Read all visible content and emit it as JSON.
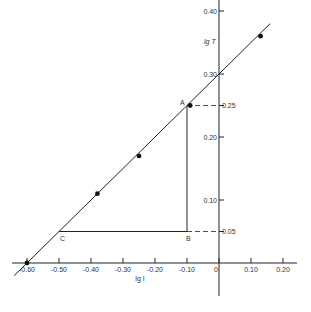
{
  "chart_data": {
    "type": "line",
    "title": "",
    "xlabel": "lg I",
    "ylabel": "lg T",
    "xlim": [
      -0.64,
      0.22
    ],
    "ylim": [
      -0.08,
      0.42
    ],
    "x_ticks": [
      -0.6,
      -0.5,
      -0.4,
      -0.3,
      -0.2,
      -0.1,
      0,
      0.1,
      0.2
    ],
    "x_tick_labels": [
      "-0.60",
      "-0.50",
      "-0.40",
      "-0.30",
      "-0.20",
      "-0.10",
      "0",
      "0.10",
      "0.20"
    ],
    "y_ticks": [
      0.05,
      0.1,
      0.2,
      0.25,
      0.3,
      0.4
    ],
    "y_tick_labels": [
      "0.05",
      "0.10",
      "0.20",
      "0.25",
      "0.30",
      "0.40"
    ],
    "grid": false,
    "series": [
      {
        "name": "data points",
        "x": [
          -0.6,
          -0.38,
          -0.25,
          -0.09,
          0.13
        ],
        "y": [
          0.0,
          0.11,
          0.17,
          0.25,
          0.36
        ]
      },
      {
        "name": "fitted line",
        "x": [
          -0.64,
          0.16
        ],
        "y": [
          -0.02,
          0.38
        ]
      }
    ],
    "annotations": [
      {
        "label": "A",
        "x": -0.1,
        "y": 0.25
      },
      {
        "label": "B",
        "x": -0.1,
        "y": 0.05
      },
      {
        "label": "C",
        "x": -0.5,
        "y": 0.05
      }
    ],
    "slope_triangle": {
      "A": [
        -0.1,
        0.25
      ],
      "B": [
        -0.1,
        0.05
      ],
      "C": [
        -0.5,
        0.05
      ]
    }
  },
  "labels": {
    "x_axis": "lg I",
    "y_axis": "lg T",
    "A": "A",
    "B": "B",
    "C": "C"
  }
}
